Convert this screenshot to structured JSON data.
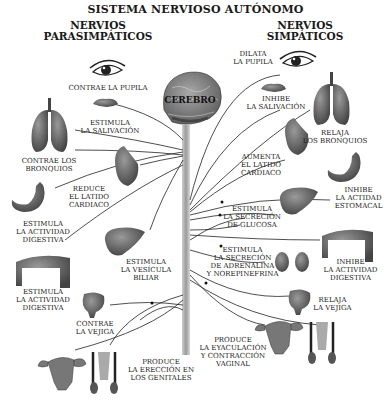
{
  "title": "SISTEMA NERVIOSO AUTÓNOMO",
  "center": {
    "label": "CEREBRO",
    "organ": "brain",
    "spine": "spinal-cord"
  },
  "parasympathetic": {
    "heading_line1": "NERVIOS",
    "heading_line2": "PARASIMPÁTICOS",
    "effects": [
      {
        "organ": "eye",
        "label": "CONTRAE LA PUPILA"
      },
      {
        "organ": "salivary-gland",
        "label": "ESTIMULA\nLA SALIVACIÓN"
      },
      {
        "organ": "lungs",
        "label": "CONTRAE LOS\nBRONQUIOS"
      },
      {
        "organ": "heart",
        "label": "REDUCE\nEL LATIDO\nCARDIACO"
      },
      {
        "organ": "stomach",
        "label": "ESTIMULA\nLA ACTIVIDAD\nDIGESTIVA"
      },
      {
        "organ": "liver",
        "label": "ESTIMULA\nLA VESÍCULA\nBILIAR"
      },
      {
        "organ": "intestine",
        "label": "ESTIMULA\nLA ACTIVIDAD\nDIGESTIVA"
      },
      {
        "organ": "bladder",
        "label": "CONTRAE\nLA VEJIGA"
      },
      {
        "organ": "genitals",
        "label": "PRODUCE\nLA ERECCIÓN EN\nLOS GENITALES"
      }
    ]
  },
  "sympathetic": {
    "heading_line1": "NERVIOS",
    "heading_line2": "SIMPÁTICOS",
    "effects": [
      {
        "organ": "eye",
        "label": "DILATA\nLA PUPILA"
      },
      {
        "organ": "salivary-gland",
        "label": "INHIBE\nLA SALIVACIÓN"
      },
      {
        "organ": "lungs",
        "label": "RELAJA\nLOS BRONQUIOS"
      },
      {
        "organ": "heart",
        "label": "AUMENTA\nEL LATIDO\nCARDIACO"
      },
      {
        "organ": "stomach",
        "label": "INHIBE\nLA ACTIDAD\nESTOMACAL"
      },
      {
        "organ": "liver",
        "label": "ESTIMULA\nLA SECRECIÓN\nDE GLUCOSA"
      },
      {
        "organ": "kidneys",
        "label": "ESTIMULA\nLA SECRECIÓN\nDE ADRENALINA\nY NOREPINEFRINA"
      },
      {
        "organ": "intestine",
        "label": "INHIBE\nLA ACTIVIDAD\nDIGESTIVA"
      },
      {
        "organ": "bladder",
        "label": "RELAJA\nLA VEJIGA"
      },
      {
        "organ": "genitals",
        "label": "PRODUCE\nLA EYACULACIÓN\nY CONTRACCIÓN\nVAGINAL"
      }
    ]
  }
}
